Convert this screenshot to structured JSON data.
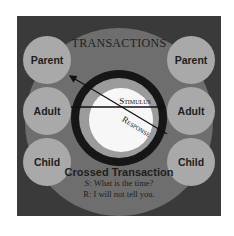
{
  "diagram": {
    "title": "TRANSACTIONS",
    "left_column": [
      {
        "label": "Parent"
      },
      {
        "label": "Adult"
      },
      {
        "label": "Child"
      }
    ],
    "right_column": [
      {
        "label": "Parent"
      },
      {
        "label": "Adult"
      },
      {
        "label": "Child"
      }
    ],
    "arrows": [
      {
        "label": "Stimulus",
        "from": "left-adult",
        "to": "right-adult"
      },
      {
        "label": "Response",
        "from": "right-child",
        "to": "left-parent"
      }
    ],
    "caption": {
      "title": "Crossed Transaction",
      "lines": [
        "S: What is the time?",
        "R: I will not tell you."
      ]
    },
    "colors": {
      "background": "#3a3a3a",
      "ring": "#6e6e6e",
      "node": "#a9a9a9",
      "center_ring": "#161616",
      "center": "#f7f7f7"
    }
  }
}
